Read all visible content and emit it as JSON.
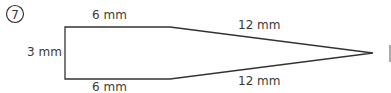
{
  "problem": {
    "number": "7",
    "number_glyph": "⑦"
  },
  "figure": {
    "shape": "pencil-like pentagon (rectangle with pointed tip)",
    "labels": {
      "top_rect": "6 mm",
      "bottom_rect": "6 mm",
      "left_side": "3 mm",
      "top_slant": "12 mm",
      "bottom_slant": "12 mm"
    }
  }
}
